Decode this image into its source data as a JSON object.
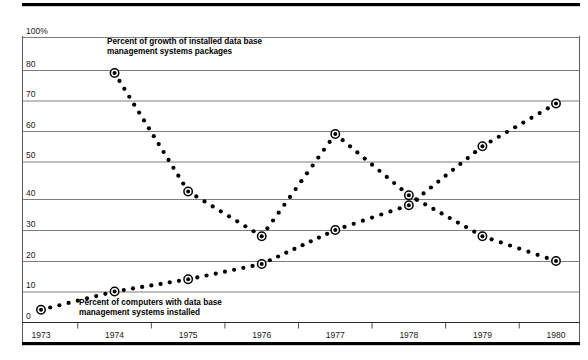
{
  "chart_data": {
    "type": "line",
    "title": "",
    "subtitle": "",
    "xlabel": "",
    "ylabel": "",
    "x": [
      1973,
      1974,
      1975,
      1976,
      1977,
      1978,
      1979,
      1980
    ],
    "xticklabels": [
      "1973",
      "1974",
      "1975",
      "1976",
      "1977",
      "1978",
      "1979",
      "1980"
    ],
    "yticklabels": [
      "100%",
      "80",
      "70",
      "60",
      "50",
      "40",
      "30",
      "20",
      "10",
      "0"
    ],
    "yticks": [
      100,
      80,
      70,
      60,
      50,
      40,
      30,
      20,
      10,
      0
    ],
    "ylim": [
      0,
      100
    ],
    "grid": "horizontal",
    "legend": "inline-annotations",
    "marker_style": "dotted-line-with-target-markers",
    "series": [
      {
        "name": "Percent of growth of installed data base management systems packages",
        "x": [
          1974,
          1975,
          1976,
          1977,
          1978,
          1979,
          1980
        ],
        "values": [
          79,
          42,
          28,
          59,
          41,
          28,
          20
        ],
        "color": "#000000"
      },
      {
        "name": "Percent of computers with data base management systems installed",
        "x": [
          1973,
          1974,
          1975,
          1976,
          1977,
          1978,
          1979,
          1980
        ],
        "values": [
          4,
          10,
          14,
          19,
          30,
          38,
          55,
          69
        ],
        "color": "#000000"
      }
    ],
    "annotations": [
      {
        "id": "growth-label",
        "lines": [
          "Percent of growth of installed data base",
          "management systems packages"
        ],
        "x": 107,
        "y": 44
      },
      {
        "id": "installed-label",
        "lines": [
          "Percent of computers with data base",
          "management systems installed"
        ],
        "x": 79,
        "y": 305
      }
    ]
  },
  "colors": {
    "rule": "#000000",
    "gridline": "#6f6f6f",
    "marker": "#000000",
    "background": "#ffffff"
  }
}
